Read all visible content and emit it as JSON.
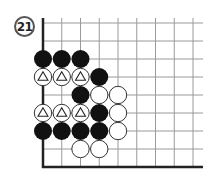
{
  "diagram": {
    "label": "21",
    "board": {
      "columns": 9,
      "rows": 9,
      "origin_x": 43,
      "origin_y": 23,
      "spacing_x": 18.75,
      "spacing_y": 18,
      "line_extent_right": 203,
      "line_top": 18,
      "left_edge": true,
      "bottom_edge": true
    },
    "stones": [
      {
        "color": "black",
        "col": 0,
        "row": 2
      },
      {
        "color": "black",
        "col": 1,
        "row": 2
      },
      {
        "color": "black",
        "col": 2,
        "row": 2
      },
      {
        "color": "white",
        "col": 0,
        "row": 3,
        "marker": "triangle"
      },
      {
        "color": "white",
        "col": 1,
        "row": 3,
        "marker": "triangle"
      },
      {
        "color": "white",
        "col": 2,
        "row": 3,
        "marker": "triangle"
      },
      {
        "color": "black",
        "col": 3,
        "row": 3
      },
      {
        "color": "black",
        "col": 2,
        "row": 4
      },
      {
        "color": "white",
        "col": 3,
        "row": 4
      },
      {
        "color": "white",
        "col": 4,
        "row": 4
      },
      {
        "color": "white",
        "col": 0,
        "row": 5,
        "marker": "triangle"
      },
      {
        "color": "white",
        "col": 1,
        "row": 5,
        "marker": "triangle"
      },
      {
        "color": "white",
        "col": 2,
        "row": 5,
        "marker": "triangle"
      },
      {
        "color": "black",
        "col": 3,
        "row": 5
      },
      {
        "color": "white",
        "col": 4,
        "row": 5
      },
      {
        "color": "black",
        "col": 0,
        "row": 6
      },
      {
        "color": "black",
        "col": 1,
        "row": 6
      },
      {
        "color": "black",
        "col": 2,
        "row": 6
      },
      {
        "color": "black",
        "col": 3,
        "row": 6
      },
      {
        "color": "white",
        "col": 4,
        "row": 6
      },
      {
        "color": "white",
        "col": 2,
        "row": 7
      },
      {
        "color": "white",
        "col": 3,
        "row": 7
      }
    ],
    "colors": {
      "grid": "#9a9a9a",
      "edge": "#222222",
      "black_stone": "#111111",
      "white_stone": "#ffffff",
      "stone_outline": "#333333"
    }
  }
}
